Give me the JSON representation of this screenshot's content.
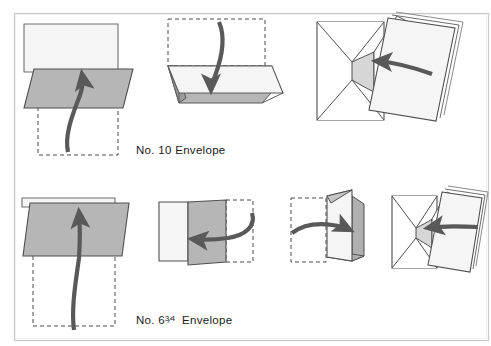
{
  "figure": {
    "background_color": "#ffffff",
    "frame_color": "#c8c8c8",
    "ink_color": "#3d3d3d",
    "paper_fill": "#f4f4f4",
    "shade_fill": "#b6b6b6",
    "shade_fill_dark": "#9a9a9a",
    "arrow_color": "#595959",
    "dashed_color": "#4a4a4a"
  },
  "rows": [
    {
      "id": "row-no10",
      "caption": {
        "prefix": "No. 10",
        "full": "No. 10 Envelope",
        "number": "10",
        "suffix": "Envelope"
      },
      "steps": [
        {
          "id": "no10-step-1",
          "label": "fold bottom third up",
          "arrow": "up-curved"
        },
        {
          "id": "no10-step-2",
          "label": "fold top third down",
          "arrow": "down-curved"
        },
        {
          "id": "no10-step-3",
          "label": "insert folded letter into envelope",
          "arrow": "left-straight"
        }
      ]
    },
    {
      "id": "row-no634",
      "caption": {
        "prefix": "No. 6",
        "full": "No. 6 3/4 Envelope",
        "number": "6",
        "fraction_numerator": "3",
        "fraction_denominator": "4",
        "suffix": "Envelope"
      },
      "steps": [
        {
          "id": "no634-step-1",
          "label": "fold bottom half up",
          "arrow": "up-curved"
        },
        {
          "id": "no634-step-2",
          "label": "fold right side left",
          "arrow": "left-curved"
        },
        {
          "id": "no634-step-3",
          "label": "fold left side right",
          "arrow": "right-curved"
        },
        {
          "id": "no634-step-4",
          "label": "insert folded letter into envelope",
          "arrow": "left-straight"
        }
      ]
    }
  ]
}
